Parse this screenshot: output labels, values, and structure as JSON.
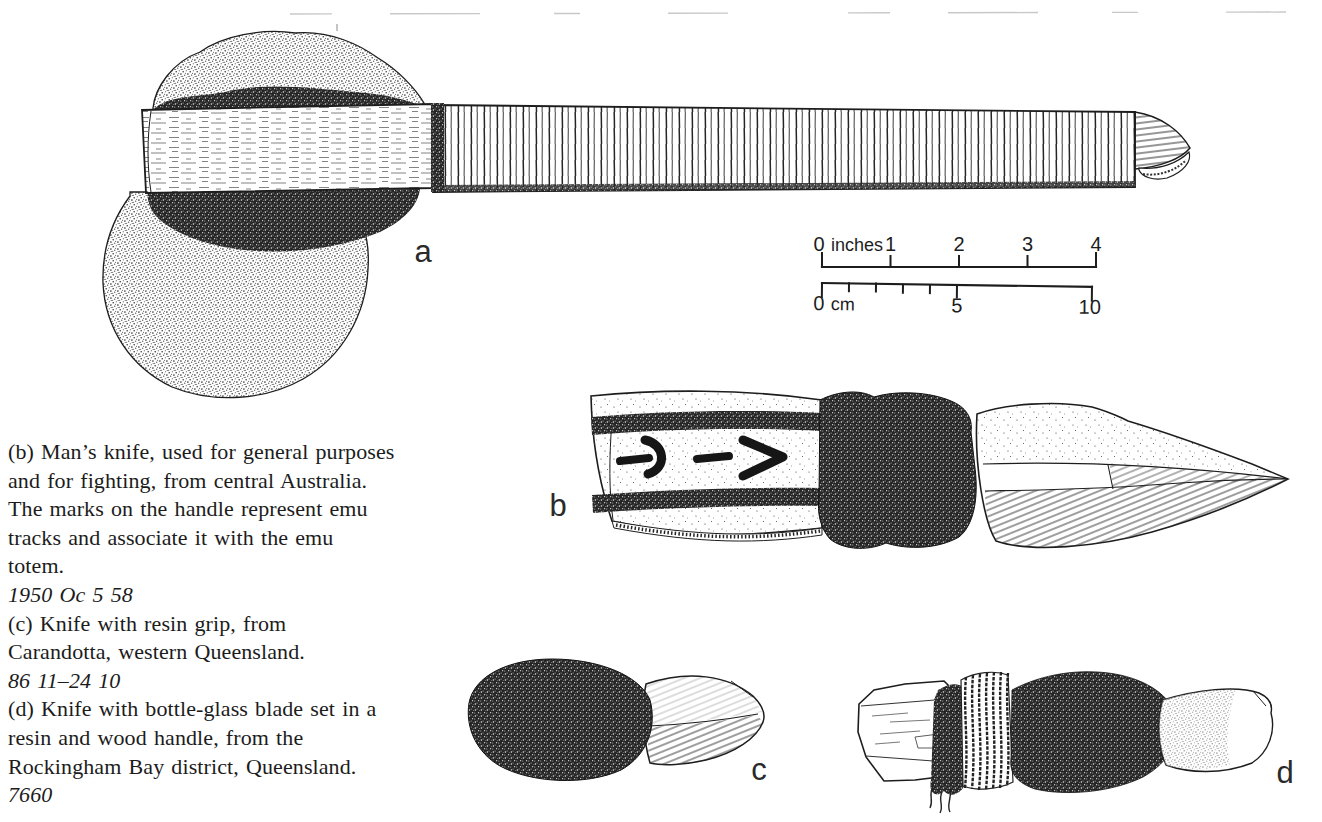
{
  "colors": {
    "paper": "#ffffff",
    "ink": "#1d1d1d"
  },
  "figures": {
    "a": {
      "label": "a"
    },
    "b": {
      "label": "b"
    },
    "c": {
      "label": "c"
    },
    "d": {
      "label": "d"
    }
  },
  "scale_bar": {
    "inches": {
      "zero": "0",
      "unit": "inches",
      "ticks": [
        "1",
        "2",
        "3",
        "4"
      ]
    },
    "cm": {
      "zero": "0",
      "unit": "cm",
      "mid": "5",
      "end": "10"
    }
  },
  "caption": {
    "lines": [
      {
        "t": "(b) Man’s knife, used for general purposes"
      },
      {
        "t": "and for fighting, from central Australia."
      },
      {
        "t": "The marks on the handle represent emu"
      },
      {
        "t": "tracks and associate it with the emu"
      },
      {
        "t": "totem."
      },
      {
        "t": "1950 Oc 5 58"
      },
      {
        "t": "(c) Knife with resin grip, from"
      },
      {
        "t": "Carandotta, western Queensland."
      },
      {
        "t": "86 11–24 10"
      },
      {
        "t": "(d) Knife with bottle-glass blade set in a"
      },
      {
        "t": "resin and wood handle, from the"
      },
      {
        "t": "Rockingham Bay district, Queensland."
      },
      {
        "t": "7660"
      }
    ]
  }
}
